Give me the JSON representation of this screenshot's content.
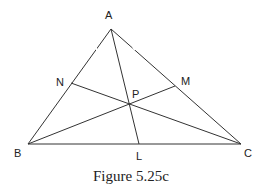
{
  "figure": {
    "caption": "Figure 5.25c",
    "points": {
      "A": {
        "label": "A",
        "x": 111,
        "y": 29
      },
      "B": {
        "label": "B",
        "x": 28,
        "y": 144
      },
      "C": {
        "label": "C",
        "x": 241,
        "y": 144
      },
      "N": {
        "label": "N",
        "x": 71,
        "y": 83
      },
      "M": {
        "label": "M",
        "x": 175,
        "y": 86
      },
      "P": {
        "label": "P",
        "x": 130,
        "y": 104
      },
      "L": {
        "label": "L",
        "x": 139,
        "y": 144
      }
    },
    "segments": [
      [
        "A",
        "B"
      ],
      [
        "A",
        "C"
      ],
      [
        "B",
        "C"
      ],
      [
        "A",
        "L"
      ],
      [
        "B",
        "M"
      ],
      [
        "C",
        "N"
      ]
    ],
    "line_color": "#333333",
    "text_color": "#222222"
  }
}
